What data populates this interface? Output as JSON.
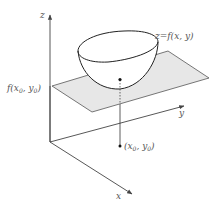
{
  "diagram": {
    "title": "",
    "axes": {
      "x_label": "x",
      "y_label": "y",
      "z_label": "z"
    },
    "labels": {
      "surface": "z=f(x, y)",
      "tangent_value_f": "f(",
      "tangent_value_x": "x",
      "tangent_value_sep": ", ",
      "tangent_value_y": "y",
      "tangent_value_sub": "0",
      "tangent_value_close": ")",
      "point_open": "(",
      "point_x": "x",
      "point_sep": ", ",
      "point_y": "y",
      "point_sub": "0",
      "point_close": ")"
    },
    "colors": {
      "axis": "#444444",
      "plane_fill": "#e6e6e6",
      "plane_stroke": "#555555",
      "surface_stroke": "#222222",
      "label": "#555555"
    },
    "elements": [
      "z-axis",
      "y-axis",
      "x-axis",
      "horizontal-plane at z=f(x0,y0)",
      "paraboloid bowl surface z=f(x,y)",
      "minimum point on surface",
      "vertical dashed projection line",
      "point (x0,y0) in xy-plane"
    ]
  }
}
